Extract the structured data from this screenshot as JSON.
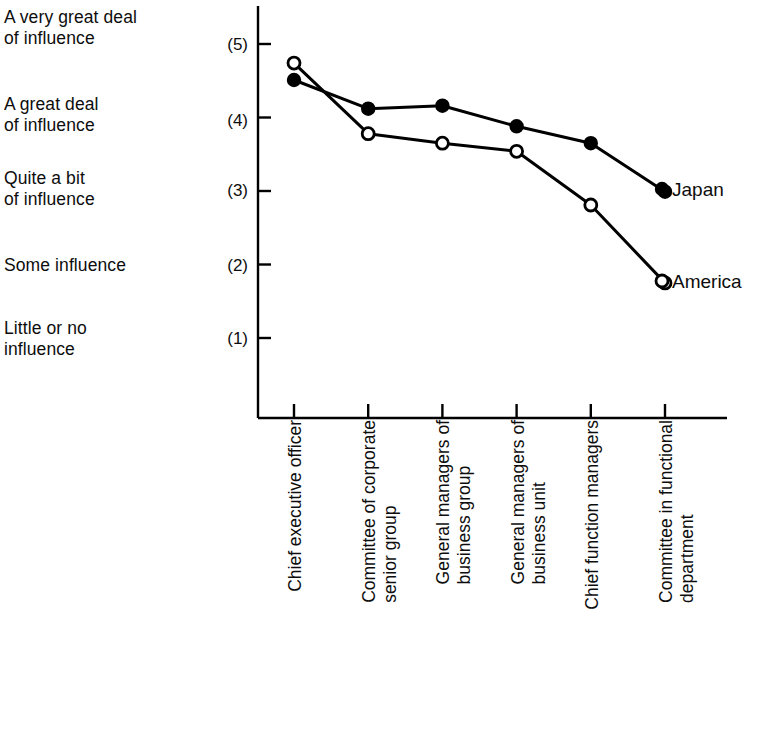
{
  "chart_data": {
    "type": "line",
    "title": "",
    "subtitle": "",
    "xlabel": "",
    "ylabel": "",
    "ylim": [
      0.45,
      5.6
    ],
    "grid": false,
    "legend_position": "right-inline-end-of-line",
    "y_tick_values": [
      5,
      4,
      3,
      2,
      1
    ],
    "y_tick_labels": [
      "(5)",
      "(4)",
      "(3)",
      "(2)",
      "(1)"
    ],
    "y_scale_descriptions": [
      {
        "value": 5,
        "text": "A very great deal\nof influence"
      },
      {
        "value": 4,
        "text": "A great deal\nof influence"
      },
      {
        "value": 3,
        "text": "Quite a bit\nof influence"
      },
      {
        "value": 2,
        "text": "Some influence"
      },
      {
        "value": 1,
        "text": "Little or no\ninfluence"
      }
    ],
    "categories": [
      "Chief executive officer",
      "Committee of corporate\nsenior group",
      "General managers of\nbusiness group",
      "General managers of\nbusiness unit",
      "Chief function managers",
      "Committee in functional\ndepartment"
    ],
    "series": [
      {
        "name": "Japan",
        "marker": "filled-circle",
        "color": "#000000",
        "values": [
          4.51,
          4.12,
          4.16,
          3.88,
          3.65,
          2.99
        ]
      },
      {
        "name": "America",
        "marker": "open-circle",
        "color": "#000000",
        "values": [
          4.74,
          3.78,
          3.65,
          3.54,
          2.81,
          1.75
        ]
      }
    ]
  },
  "legend": {
    "japan_label": "Japan",
    "america_label": "America"
  }
}
